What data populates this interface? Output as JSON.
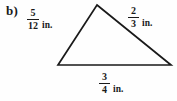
{
  "figure": {
    "part_label": "b)",
    "shape": "triangle",
    "stroke_color": "#1a1a1a",
    "background_color": "#fefefe",
    "vertices": {
      "apex": [
        97,
        5
      ],
      "bottom_left": [
        58,
        65
      ],
      "bottom_right": [
        171,
        65
      ]
    },
    "sides": [
      {
        "id": "left-side",
        "numerator": "5",
        "denominator": "12",
        "unit": "in."
      },
      {
        "id": "right-side",
        "numerator": "2",
        "denominator": "3",
        "unit": "in."
      },
      {
        "id": "base-side",
        "numerator": "3",
        "denominator": "4",
        "unit": "in."
      }
    ]
  }
}
